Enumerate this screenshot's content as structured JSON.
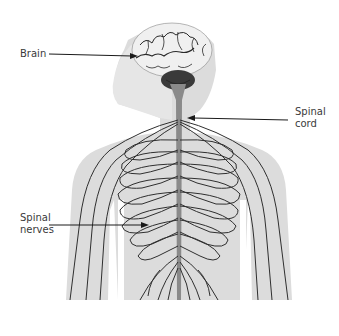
{
  "diagram": {
    "labels": {
      "brain": {
        "line1": "Brain"
      },
      "spinal_cord": {
        "line1": "Spinal",
        "line2": "cord"
      },
      "spinal_nerves": {
        "line1": "Spinal",
        "line2": "nerves"
      }
    },
    "colors": {
      "background": "#ffffff",
      "body_silhouette": "#d9d9d9",
      "head_silhouette": "#e4e4e4",
      "brain": "#eeeeee",
      "brain_folds": "#2a2a2a",
      "cerebellum": "#3a3a3a",
      "spinal_cord": "#8a8a8a",
      "nerves": "#2f2f2f",
      "label_text": "#3a3a3a",
      "arrow": "#1a1a1a"
    }
  }
}
